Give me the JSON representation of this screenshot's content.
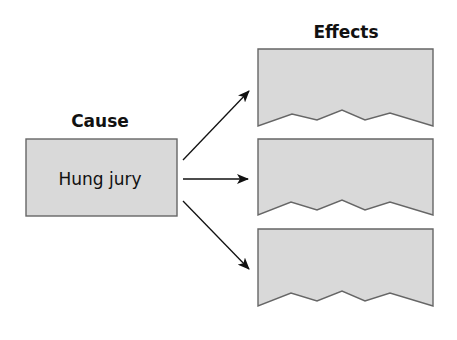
{
  "diagram": {
    "type": "cause-effect",
    "cause": {
      "heading": "Cause",
      "label": "Hung jury"
    },
    "effects": {
      "heading": "Effects",
      "items": [
        {
          "label": ""
        },
        {
          "label": ""
        },
        {
          "label": ""
        }
      ]
    },
    "colors": {
      "box_fill": "#d9d9d9",
      "box_stroke": "#666666",
      "text": "#111111",
      "background": "#ffffff"
    }
  }
}
